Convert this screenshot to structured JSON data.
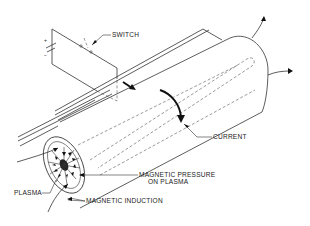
{
  "diagram": {
    "labels": {
      "switch": "SWITCH",
      "current": "CURRENT",
      "magnetic_pressure_line1": "MAGNETIC PRESSURE",
      "magnetic_pressure_line2": "ON PLASMA",
      "plasma": "PLASMA",
      "magnetic_induction": "MAGNETIC INDUCTION"
    },
    "battery_marks": {
      "plus": "+",
      "minus": "−"
    },
    "colors": {
      "line": "#333333",
      "background": "#ffffff"
    }
  }
}
